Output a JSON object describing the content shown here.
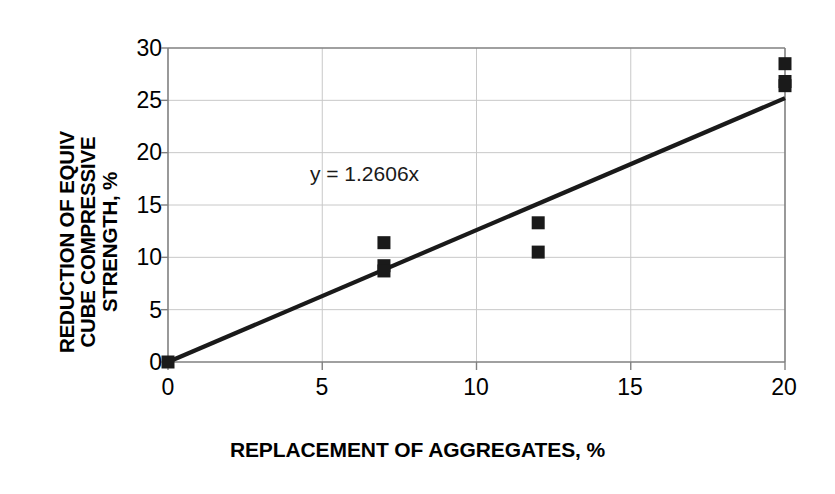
{
  "chart_data": {
    "type": "scatter",
    "title": "",
    "xlabel": "REPLACEMENT OF AGGREGATES, %",
    "ylabel": "REDUCTION OF EQUIV CUBE COMPRESSIVE STRENGTH, %",
    "ylabel_lines": [
      "REDUCTION OF EQUIV",
      "CUBE COMPRESSIVE",
      "STRENGTH, %"
    ],
    "xlim": [
      0,
      20
    ],
    "ylim": [
      0,
      30
    ],
    "xticks": [
      0,
      5,
      10,
      15,
      20
    ],
    "yticks": [
      0,
      5,
      10,
      15,
      20,
      25,
      30
    ],
    "xtick_labels": [
      "0",
      "5",
      "10",
      "15",
      "20"
    ],
    "ytick_labels": [
      "0",
      "5",
      "10",
      "15",
      "20",
      "25",
      "30"
    ],
    "grid": true,
    "legend": "none",
    "marker_style": "filled-square",
    "marker_color": "#1a1a1a",
    "line_color": "#1a1a1a",
    "grid_color": "#c8c8c8",
    "axis_color": "#808080",
    "background": "#ffffff",
    "annotations": [
      {
        "text": "y = 1.2606x",
        "x": 4.6,
        "y": 17.3
      }
    ],
    "series": [
      {
        "name": "Measured reduction",
        "type": "scatter",
        "points": [
          {
            "x": 0,
            "y": 0
          },
          {
            "x": 7,
            "y": 11.4
          },
          {
            "x": 7,
            "y": 9.2
          },
          {
            "x": 7,
            "y": 8.7
          },
          {
            "x": 12,
            "y": 13.3
          },
          {
            "x": 12,
            "y": 10.5
          },
          {
            "x": 20,
            "y": 28.5
          },
          {
            "x": 20,
            "y": 26.8
          },
          {
            "x": 20,
            "y": 26.4
          }
        ]
      },
      {
        "name": "Trend line",
        "type": "line",
        "equation": "y = 1.2606x",
        "slope": 1.2606,
        "intercept": 0,
        "points": [
          {
            "x": 0,
            "y": 0
          },
          {
            "x": 20,
            "y": 25.21
          }
        ]
      }
    ]
  }
}
